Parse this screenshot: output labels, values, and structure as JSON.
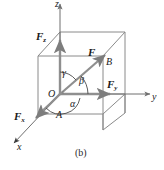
{
  "figure": {
    "caption": "(b)",
    "colors": {
      "cube_edge": "#8a8a8a",
      "axis": "#6f6f6f",
      "vector": "#7d7d7d",
      "text": "#1a1a1a"
    }
  },
  "axes": [
    {
      "name": "z",
      "label": "z",
      "direction": "up"
    },
    {
      "name": "y",
      "label": "y",
      "direction": "right"
    },
    {
      "name": "x",
      "label": "x",
      "direction": "down-left"
    }
  ],
  "vectors": [
    {
      "name": "resultant",
      "label": "F",
      "subscript": ""
    },
    {
      "name": "x-component",
      "label": "F",
      "subscript": "x"
    },
    {
      "name": "y-component",
      "label": "F",
      "subscript": "y"
    },
    {
      "name": "z-component",
      "label": "F",
      "subscript": "z"
    }
  ],
  "angles": [
    {
      "name": "alpha",
      "symbol": "α"
    },
    {
      "name": "beta",
      "symbol": "β"
    },
    {
      "name": "gamma",
      "symbol": "γ"
    }
  ],
  "points": [
    {
      "name": "origin",
      "label": "O"
    },
    {
      "name": "point-a",
      "label": "A"
    },
    {
      "name": "point-b",
      "label": "B"
    }
  ]
}
